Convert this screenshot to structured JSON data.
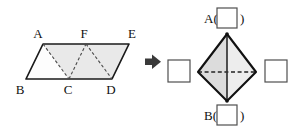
{
  "figure": {
    "title": "",
    "net_figure": {
      "name": "tetrahedron-net-parallelogram",
      "shape": "parallelogram",
      "fill_color": "#e9e9e9",
      "stroke_color": "#1a1a1a",
      "fold_line_style": "dashed",
      "vertex_labels": {
        "A": "A",
        "B": "B",
        "C": "C",
        "D": "D",
        "E": "E",
        "F": "F"
      },
      "vertices": {
        "A": {
          "x": 43,
          "y": 44
        },
        "F": {
          "x": 86,
          "y": 44
        },
        "E": {
          "x": 129,
          "y": 44
        },
        "B": {
          "x": 26,
          "y": 79
        },
        "C": {
          "x": 69,
          "y": 79
        },
        "D": {
          "x": 112,
          "y": 79
        }
      },
      "outline_path": "A F E D C B",
      "fold_edges": [
        "A-C",
        "C-F",
        "F-D"
      ],
      "triangle_count": 4
    },
    "arrow": {
      "name": "transform-arrow",
      "direction": "right",
      "glyph": "➤",
      "color": "#3a3a3a",
      "x": 152,
      "y": 62
    },
    "solid_figure": {
      "name": "tetrahedron",
      "fill_color": "#e4e4e4",
      "stroke_color": "#1a1a1a",
      "hidden_edge_style": "dashed",
      "vertices": {
        "apex": {
          "x": 227,
          "y": 34
        },
        "left": {
          "x": 198,
          "y": 72
        },
        "right": {
          "x": 256,
          "y": 72
        },
        "bottom": {
          "x": 227,
          "y": 101
        }
      },
      "solid_edges": [
        "apex-left",
        "apex-right",
        "apex-bottom",
        "left-bottom",
        "right-bottom"
      ],
      "dashed_edges": [
        "left-right"
      ]
    },
    "answer_boxes": [
      {
        "id": "top",
        "name": "answer-box-top",
        "prefix": "A(",
        "suffix": ")",
        "value": "",
        "x": 217,
        "y": 8,
        "width": 20,
        "height": 20
      },
      {
        "id": "left",
        "name": "answer-box-left",
        "prefix": "",
        "suffix": "",
        "value": "",
        "x": 168,
        "y": 60,
        "width": 22,
        "height": 22
      },
      {
        "id": "right",
        "name": "answer-box-right",
        "prefix": "",
        "suffix": "",
        "value": "",
        "x": 265,
        "y": 60,
        "width": 22,
        "height": 22
      },
      {
        "id": "bottom",
        "name": "answer-box-bottom",
        "prefix": "B(",
        "suffix": ")",
        "value": "",
        "x": 217,
        "y": 105,
        "width": 20,
        "height": 20
      }
    ]
  }
}
